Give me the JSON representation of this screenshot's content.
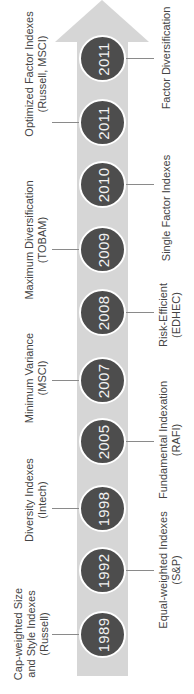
{
  "diagram": {
    "title": "",
    "arrow_color": "#d6d6d6",
    "node_color": "#4d4d4d",
    "milestones": [
      {
        "year": "1989",
        "side": "left",
        "lines": [
          "Cap-weighted Size",
          "and Style Indexes",
          "(Russell)"
        ]
      },
      {
        "year": "1992",
        "side": "right",
        "lines": [
          "Equal-weighted Indexes",
          "(S&P)"
        ]
      },
      {
        "year": "1998",
        "side": "left",
        "lines": [
          "Diversity Indexes",
          "(Intech)"
        ]
      },
      {
        "year": "2005",
        "side": "right",
        "lines": [
          "Fundamental Indexation",
          "(RAFI)"
        ]
      },
      {
        "year": "2007",
        "side": "left",
        "lines": [
          "Minimum Variance",
          "(MSCI)"
        ]
      },
      {
        "year": "2008",
        "side": "right",
        "lines": [
          "Risk-Efficient",
          "(EDHEC)"
        ]
      },
      {
        "year": "2009",
        "side": "left",
        "lines": [
          "Maximum Diversification",
          "(TOBAM)"
        ]
      },
      {
        "year": "2010",
        "side": "right",
        "lines": [
          "Single Factor Indexes"
        ]
      },
      {
        "year": "2011",
        "side": "left",
        "lines": [
          "Optimized Factor Indexes",
          "(Russell, MSCI)"
        ]
      },
      {
        "year": "2011",
        "side": "right",
        "lines": [
          "Factor Diversification"
        ]
      }
    ]
  }
}
